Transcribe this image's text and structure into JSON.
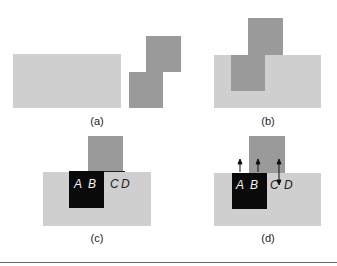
{
  "panels": [
    {
      "id": "a",
      "label": "(a)"
    },
    {
      "id": "b",
      "label": "(b)"
    },
    {
      "id": "c",
      "label": "(c)",
      "texts": [
        "A",
        "B",
        "C",
        "D"
      ]
    },
    {
      "id": "d",
      "label": "(d)",
      "texts": [
        "A",
        "B",
        "C",
        "D"
      ]
    }
  ],
  "colors": {
    "light": "#cfcfcf",
    "dark": "#9a9a9a",
    "black": "#0a0a0a"
  }
}
